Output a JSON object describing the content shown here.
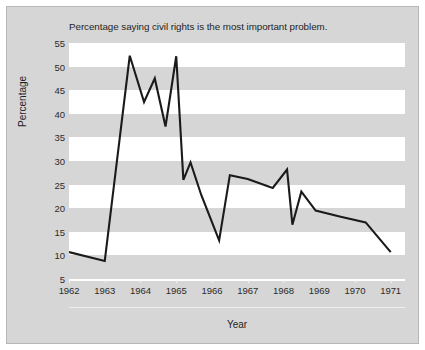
{
  "chart_data": {
    "type": "line",
    "title": "Percentage saying civil rights is the most important problem.",
    "xlabel": "Year",
    "ylabel": "Percentage",
    "ylim": [
      5,
      55
    ],
    "yticks": [
      5,
      10,
      15,
      20,
      25,
      30,
      35,
      40,
      45,
      50,
      55
    ],
    "xlim": [
      1962,
      1971.4
    ],
    "xticks": [
      1962,
      1963,
      1964,
      1965,
      1966,
      1967,
      1968,
      1969,
      1970,
      1971
    ],
    "xtick_labels": [
      "1962",
      "1963",
      "1964",
      "1965",
      "1966",
      "1967",
      "1968",
      "1969",
      "1970",
      "1971"
    ],
    "grid": "horizontal alternating white/gray bands, 5-unit height",
    "legend": null,
    "series": [
      {
        "name": "Civil rights most important problem",
        "color": "#1a1a1a",
        "x": [
          1962.0,
          1963.0,
          1963.7,
          1964.1,
          1964.4,
          1964.7,
          1965.0,
          1965.2,
          1965.4,
          1965.7,
          1966.2,
          1966.5,
          1967.0,
          1967.7,
          1968.1,
          1968.25,
          1968.5,
          1968.9,
          1969.6,
          1970.3,
          1971.0
        ],
        "y": [
          10.7,
          8.8,
          52.3,
          42.5,
          47.5,
          37.3,
          52.2,
          26.0,
          29.7,
          22.8,
          13.2,
          27.0,
          26.2,
          24.3,
          28.2,
          16.5,
          23.5,
          19.5,
          18.2,
          17.0,
          10.7
        ]
      }
    ]
  },
  "colors": {
    "canvas": "#d6d6d6",
    "band_white": "#ffffff",
    "band_gray": "#d6d6d6",
    "series": "#1a1a1a",
    "text": "#1f1f1f",
    "frame": "#b7b7b7"
  }
}
